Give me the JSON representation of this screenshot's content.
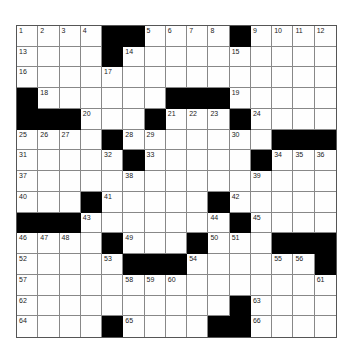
{
  "puzzle": {
    "rows": 15,
    "cols": 15,
    "black_cells": [
      [
        0,
        4
      ],
      [
        0,
        5
      ],
      [
        0,
        10
      ],
      [
        1,
        4
      ],
      [
        3,
        0
      ],
      [
        3,
        7
      ],
      [
        3,
        8
      ],
      [
        3,
        9
      ],
      [
        4,
        0
      ],
      [
        4,
        1
      ],
      [
        4,
        2
      ],
      [
        4,
        6
      ],
      [
        4,
        10
      ],
      [
        5,
        4
      ],
      [
        5,
        12
      ],
      [
        5,
        13
      ],
      [
        5,
        14
      ],
      [
        6,
        5
      ],
      [
        6,
        11
      ],
      [
        8,
        3
      ],
      [
        8,
        9
      ],
      [
        9,
        0
      ],
      [
        9,
        1
      ],
      [
        9,
        2
      ],
      [
        9,
        10
      ],
      [
        10,
        4
      ],
      [
        10,
        8
      ],
      [
        10,
        12
      ],
      [
        10,
        13
      ],
      [
        10,
        14
      ],
      [
        11,
        5
      ],
      [
        11,
        6
      ],
      [
        11,
        7
      ],
      [
        11,
        14
      ],
      [
        13,
        10
      ],
      [
        14,
        4
      ],
      [
        14,
        9
      ],
      [
        14,
        10
      ]
    ],
    "numbers": [
      {
        "r": 0,
        "c": 0,
        "n": "1"
      },
      {
        "r": 0,
        "c": 1,
        "n": "2"
      },
      {
        "r": 0,
        "c": 2,
        "n": "3"
      },
      {
        "r": 0,
        "c": 3,
        "n": "4"
      },
      {
        "r": 0,
        "c": 6,
        "n": "5"
      },
      {
        "r": 0,
        "c": 7,
        "n": "6"
      },
      {
        "r": 0,
        "c": 8,
        "n": "7"
      },
      {
        "r": 0,
        "c": 9,
        "n": "8"
      },
      {
        "r": 0,
        "c": 11,
        "n": "9"
      },
      {
        "r": 0,
        "c": 12,
        "n": "10"
      },
      {
        "r": 0,
        "c": 13,
        "n": "11"
      },
      {
        "r": 0,
        "c": 14,
        "n": "12"
      },
      {
        "r": 1,
        "c": 0,
        "n": "13"
      },
      {
        "r": 1,
        "c": 5,
        "n": "14"
      },
      {
        "r": 1,
        "c": 10,
        "n": "15"
      },
      {
        "r": 2,
        "c": 0,
        "n": "16"
      },
      {
        "r": 2,
        "c": 4,
        "n": "17"
      },
      {
        "r": 3,
        "c": 1,
        "n": "18"
      },
      {
        "r": 3,
        "c": 10,
        "n": "19"
      },
      {
        "r": 4,
        "c": 3,
        "n": "20"
      },
      {
        "r": 4,
        "c": 7,
        "n": "21"
      },
      {
        "r": 4,
        "c": 8,
        "n": "22"
      },
      {
        "r": 4,
        "c": 9,
        "n": "23"
      },
      {
        "r": 4,
        "c": 11,
        "n": "24"
      },
      {
        "r": 5,
        "c": 0,
        "n": "25"
      },
      {
        "r": 5,
        "c": 1,
        "n": "26"
      },
      {
        "r": 5,
        "c": 2,
        "n": "27"
      },
      {
        "r": 5,
        "c": 5,
        "n": "28"
      },
      {
        "r": 5,
        "c": 6,
        "n": "29"
      },
      {
        "r": 5,
        "c": 10,
        "n": "30"
      },
      {
        "r": 6,
        "c": 0,
        "n": "31"
      },
      {
        "r": 6,
        "c": 4,
        "n": "32"
      },
      {
        "r": 6,
        "c": 6,
        "n": "33"
      },
      {
        "r": 6,
        "c": 12,
        "n": "34"
      },
      {
        "r": 6,
        "c": 13,
        "n": "35"
      },
      {
        "r": 6,
        "c": 14,
        "n": "36"
      },
      {
        "r": 7,
        "c": 0,
        "n": "37"
      },
      {
        "r": 7,
        "c": 5,
        "n": "38"
      },
      {
        "r": 7,
        "c": 11,
        "n": "39"
      },
      {
        "r": 8,
        "c": 0,
        "n": "40"
      },
      {
        "r": 8,
        "c": 4,
        "n": "41"
      },
      {
        "r": 8,
        "c": 10,
        "n": "42"
      },
      {
        "r": 9,
        "c": 3,
        "n": "43"
      },
      {
        "r": 9,
        "c": 9,
        "n": "44"
      },
      {
        "r": 9,
        "c": 11,
        "n": "45"
      },
      {
        "r": 10,
        "c": 0,
        "n": "46"
      },
      {
        "r": 10,
        "c": 1,
        "n": "47"
      },
      {
        "r": 10,
        "c": 2,
        "n": "48"
      },
      {
        "r": 10,
        "c": 5,
        "n": "49"
      },
      {
        "r": 10,
        "c": 9,
        "n": "50"
      },
      {
        "r": 10,
        "c": 10,
        "n": "51"
      },
      {
        "r": 11,
        "c": 0,
        "n": "52"
      },
      {
        "r": 11,
        "c": 4,
        "n": "53"
      },
      {
        "r": 11,
        "c": 8,
        "n": "54"
      },
      {
        "r": 11,
        "c": 12,
        "n": "55"
      },
      {
        "r": 11,
        "c": 13,
        "n": "56"
      },
      {
        "r": 12,
        "c": 0,
        "n": "57"
      },
      {
        "r": 12,
        "c": 5,
        "n": "58"
      },
      {
        "r": 12,
        "c": 6,
        "n": "59"
      },
      {
        "r": 12,
        "c": 7,
        "n": "60"
      },
      {
        "r": 12,
        "c": 14,
        "n": "61"
      },
      {
        "r": 13,
        "c": 0,
        "n": "62"
      },
      {
        "r": 13,
        "c": 11,
        "n": "63"
      },
      {
        "r": 14,
        "c": 0,
        "n": "64"
      },
      {
        "r": 14,
        "c": 5,
        "n": "65"
      },
      {
        "r": 14,
        "c": 11,
        "n": "66"
      }
    ]
  }
}
